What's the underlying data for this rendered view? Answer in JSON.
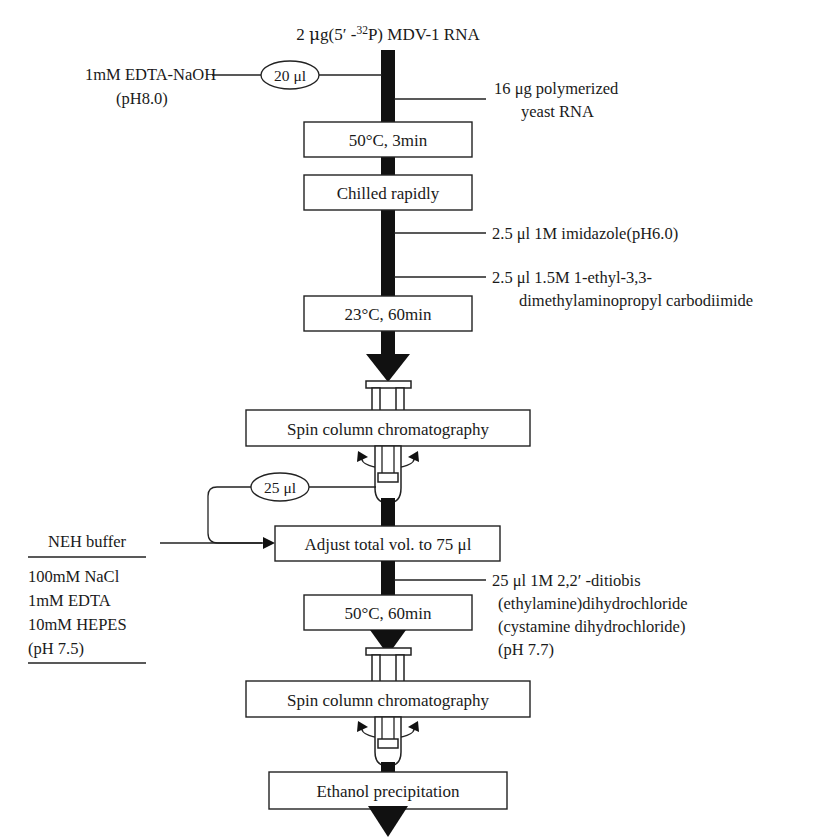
{
  "diagram": {
    "title": "2 μg(5′ -32P) MDV-1 RNA",
    "title_parts": {
      "lead": "2 ",
      "mu": "μ",
      "mid": "g(5′ -",
      "sup": "32",
      "tail": "P) MDV-1 RNA"
    },
    "steps": [
      {
        "id": "heat-1",
        "label": "50°C, 3min"
      },
      {
        "id": "chill",
        "label": "Chilled rapidly"
      },
      {
        "id": "incubate-23",
        "label": "23°C, 60min"
      },
      {
        "id": "spin-column-1",
        "label": "Spin column chromatography"
      },
      {
        "id": "adjust-volume",
        "label": "Adjust total vol. to 75 μl"
      },
      {
        "id": "heat-2",
        "label": "50°C, 60min"
      },
      {
        "id": "spin-column-2",
        "label": "Spin column chromatography"
      },
      {
        "id": "ethanol",
        "label": "Ethanol precipitation"
      }
    ],
    "volumes": [
      {
        "id": "vol-20ul",
        "label": "20 μl"
      },
      {
        "id": "vol-25ul",
        "label": "25 μl"
      }
    ],
    "left_reagents": [
      {
        "id": "edta-naoh",
        "lines": [
          "1mM EDTA-NaOH",
          "(pH8.0)"
        ]
      }
    ],
    "neh_buffer": {
      "name": "NEH buffer",
      "components": [
        "100mM NaCl",
        "1mM EDTA",
        "10mM HEPES",
        "(pH 7.5)"
      ]
    },
    "right_reagents": [
      {
        "id": "yeast-rna",
        "lines": [
          "16 μg polymerized",
          "yeast RNA"
        ]
      },
      {
        "id": "imidazole",
        "lines": [
          "2.5 μl 1M imidazole(pH6.0)"
        ]
      },
      {
        "id": "carbodiimide",
        "lines": [
          "2.5 μl 1.5M 1-ethyl-3,3-",
          "dimethylaminopropyl carbodiimide"
        ]
      },
      {
        "id": "cystamine",
        "lines": [
          "25 μl 1M 2,2′ -ditiobis",
          "(ethylamine)dihydrochloride",
          "(cystamine dihydrochloride)",
          "(pH 7.7)"
        ]
      }
    ],
    "icons": [
      {
        "id": "spin-column-icon-1",
        "name": "spin-column-icon"
      },
      {
        "id": "centrifuge-tube-icon-1",
        "name": "centrifuge-tube-icon"
      },
      {
        "id": "spin-column-icon-2",
        "name": "spin-column-icon"
      },
      {
        "id": "centrifuge-tube-icon-2",
        "name": "centrifuge-tube-icon"
      }
    ],
    "colors": {
      "ink": "#1a1a1a",
      "stroke": "#222222",
      "fill": "#111111",
      "background": "#ffffff"
    }
  }
}
